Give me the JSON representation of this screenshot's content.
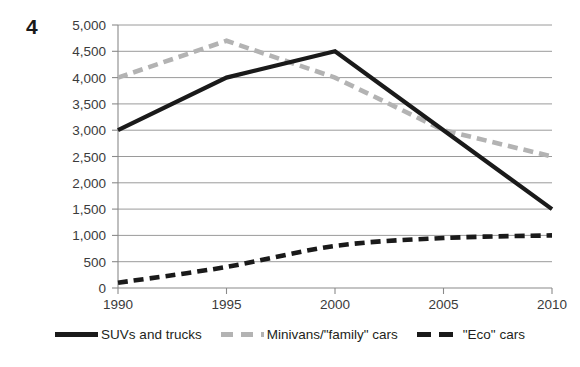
{
  "figure": {
    "number_label": "4"
  },
  "chart_data": {
    "type": "line",
    "title": "",
    "subtitle": "",
    "xlabel": "",
    "ylabel": "",
    "x": [
      1990,
      1995,
      2000,
      2005,
      2010
    ],
    "categories": [
      "1990",
      "1995",
      "2000",
      "2005",
      "2010"
    ],
    "xlim": [
      1990,
      2010
    ],
    "ylim": [
      0,
      5000
    ],
    "ytick_values": [
      0,
      500,
      1000,
      1500,
      2000,
      2500,
      3000,
      3500,
      4000,
      4500,
      5000
    ],
    "ytick_labels": [
      "0",
      "500",
      "1,000",
      "1,500",
      "2,000",
      "2,500",
      "3,000",
      "3,500",
      "4,000",
      "4,500",
      "5,000"
    ],
    "xtick_labels": [
      "1990",
      "1995",
      "2000",
      "2005",
      "2010"
    ],
    "grid": "horizontal",
    "legend_position": "bottom",
    "series": [
      {
        "name": "SUVs and trucks",
        "values": [
          3000,
          4000,
          4500,
          3000,
          1500
        ],
        "style": "solid",
        "color": "#1a1a1a"
      },
      {
        "name": "Minivans/\"family\" cars",
        "values": [
          4000,
          4700,
          4000,
          3000,
          2500
        ],
        "style": "dashed",
        "color": "#b3b3b3"
      },
      {
        "name": "\"Eco\" cars",
        "values": [
          100,
          400,
          800,
          950,
          1000
        ],
        "style": "dashed",
        "color": "#1a1a1a"
      }
    ]
  },
  "legend": {
    "items": [
      {
        "label": "SUVs and trucks",
        "swatch": "solid-black-line-swatch"
      },
      {
        "label": "Minivans/\"family\" cars",
        "swatch": "dashed-gray-line-swatch"
      },
      {
        "label": "\"Eco\" cars",
        "swatch": "dashed-black-line-swatch"
      }
    ]
  },
  "axes": {
    "y_labels": [
      "5,000",
      "4,500",
      "4,000",
      "3,500",
      "3,000",
      "2,500",
      "2,000",
      "1,500",
      "1,000",
      "500",
      "0"
    ],
    "x_labels": [
      "1990",
      "1995",
      "2000",
      "2005",
      "2010"
    ]
  }
}
